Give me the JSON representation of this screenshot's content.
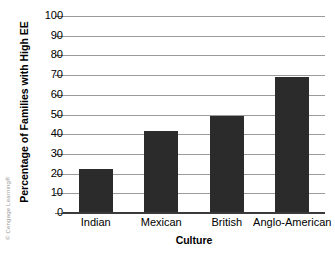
{
  "chart_data": {
    "type": "bar",
    "title": "",
    "categories": [
      "Indian",
      "Mexican",
      "British",
      "Anglo-American"
    ],
    "values": [
      22.5,
      41.5,
      49.5,
      69
    ],
    "xlabel": "Culture",
    "ylabel": "Percentage of Families with High EE",
    "ylim": [
      0,
      100
    ],
    "yticks": [
      0,
      10,
      20,
      30,
      40,
      50,
      60,
      70,
      80,
      90,
      100
    ],
    "ytick_labels": [
      "0",
      "10",
      "20",
      "30",
      "40",
      "50",
      "60",
      "70",
      "80",
      "90",
      "100"
    ],
    "grid": true,
    "legend": false,
    "bar_color": "#2b2b2b",
    "gridline_color": "#9b9b9b",
    "axis_color": "#3a3a3a",
    "background": "#ffffff"
  },
  "credit": {
    "text": "© Cengage Learning®"
  }
}
